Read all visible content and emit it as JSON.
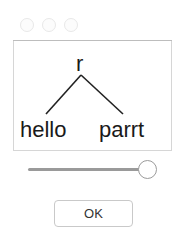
{
  "window": {
    "controls": [
      "close",
      "minimize",
      "zoom"
    ]
  },
  "tree": {
    "root": "r",
    "children": [
      "hello",
      "parrt"
    ]
  },
  "zoom_slider": {
    "value_fraction": 1.0
  },
  "buttons": {
    "ok_label": "OK"
  }
}
